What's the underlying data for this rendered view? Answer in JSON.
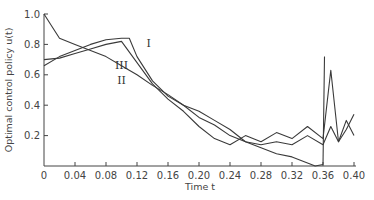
{
  "chart_data": {
    "type": "line",
    "title": "",
    "xlabel": "Time t",
    "ylabel": "Optimal control policy u(t)",
    "xlim": [
      0,
      0.4
    ],
    "ylim": [
      0,
      1.0
    ],
    "x_ticks": [
      "0",
      "0.04",
      "0.08",
      "0.12",
      "0.16",
      "0.20",
      "0.24",
      "0.28",
      "0.32",
      "0.36",
      "0.40"
    ],
    "y_ticks": [
      "0.2",
      "0.4",
      "0.6",
      "0.8",
      "1.0"
    ],
    "grid": false,
    "legend": "inline labels",
    "series": [
      {
        "name": "I",
        "x": [
          0,
          0.02,
          0.04,
          0.06,
          0.08,
          0.1,
          0.11,
          0.12,
          0.14,
          0.16,
          0.18,
          0.2,
          0.22,
          0.24,
          0.26,
          0.28,
          0.3,
          0.32,
          0.34,
          0.36,
          0.37,
          0.38,
          0.39,
          0.4
        ],
        "y": [
          0.66,
          0.72,
          0.76,
          0.8,
          0.83,
          0.84,
          0.84,
          0.72,
          0.56,
          0.46,
          0.4,
          0.36,
          0.3,
          0.24,
          0.16,
          0.14,
          0.16,
          0.14,
          0.2,
          0.14,
          0.26,
          0.16,
          0.3,
          0.2
        ]
      },
      {
        "name": "II",
        "x": [
          0,
          0.01,
          0.02,
          0.04,
          0.06,
          0.08,
          0.1,
          0.12,
          0.14,
          0.16,
          0.18,
          0.2,
          0.22,
          0.24,
          0.26,
          0.28,
          0.3,
          0.32,
          0.34,
          0.35,
          0.36,
          0.362
        ],
        "y": [
          1.0,
          0.92,
          0.84,
          0.8,
          0.76,
          0.72,
          0.66,
          0.6,
          0.53,
          0.47,
          0.4,
          0.32,
          0.27,
          0.2,
          0.16,
          0.12,
          0.08,
          0.06,
          0.02,
          0.0,
          0.01,
          0.72
        ]
      },
      {
        "name": "III",
        "x": [
          0,
          0.02,
          0.04,
          0.06,
          0.08,
          0.1,
          0.12,
          0.14,
          0.16,
          0.18,
          0.2,
          0.22,
          0.24,
          0.26,
          0.28,
          0.3,
          0.32,
          0.34,
          0.36,
          0.37,
          0.38,
          0.39,
          0.4
        ],
        "y": [
          0.7,
          0.71,
          0.74,
          0.77,
          0.8,
          0.82,
          0.68,
          0.54,
          0.44,
          0.36,
          0.26,
          0.18,
          0.14,
          0.2,
          0.16,
          0.22,
          0.18,
          0.26,
          0.18,
          0.63,
          0.16,
          0.24,
          0.34
        ]
      }
    ],
    "annotations": [
      {
        "text": "I",
        "x": 0.135,
        "y": 0.78
      },
      {
        "text": "III",
        "x": 0.1,
        "y": 0.64
      },
      {
        "text": "II",
        "x": 0.1,
        "y": 0.54
      }
    ]
  }
}
